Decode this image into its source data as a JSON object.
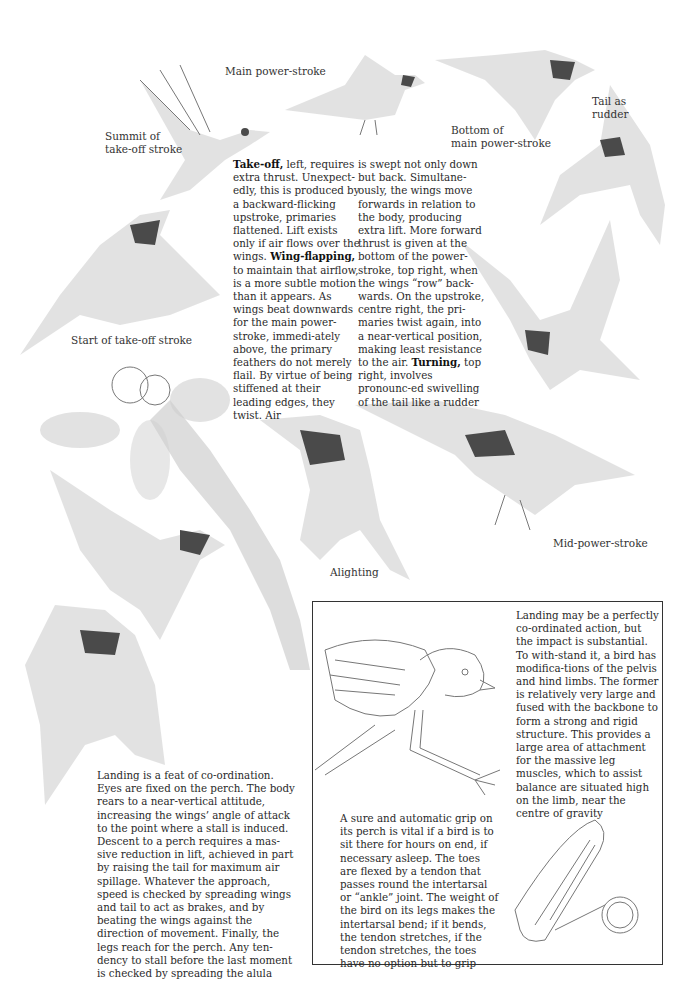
{
  "labels": {
    "main_power_stroke": "Main power-stroke",
    "summit_take_off": [
      "Summit of",
      "take-off stroke"
    ],
    "bottom_main_power": [
      "Bottom of",
      "main power-stroke"
    ],
    "tail_as_rudder": [
      "Tail as",
      "rudder"
    ],
    "start_take_off": "Start of take-off stroke",
    "alighting": "Alighting",
    "mid_power_stroke": "Mid-power-stroke"
  },
  "flight_text": {
    "column1": {
      "takeoff_bold": "Take-off,",
      "takeoff_rest": " left, requires extra thrust. Unexpect-edly, this is produced by a backward-flicking upstroke, primaries flattened. Lift exists only if air flows over the wings. ",
      "wingflapping_bold": "Wing-flapping,",
      "wingflapping_rest": " to maintain that airflow, is a more subtle motion than it appears. As wings beat downwards for the main power-stroke, immedi-ately above, the primary feathers do not merely flail. By virtue of being stiffened at their leading edges, they twist. Air"
    },
    "column2": {
      "part1": "is swept not only down but back. Simultane-ously, the wings move forwards in relation to the body, producing extra lift. More forward thrust is given at the bottom of the power-stroke, top right, when the wings “row” back-wards. On the upstroke, centre right, the pri-maries twist again, into a near-vertical position, making least resistance to the air. ",
      "turning_bold": "Turning,",
      "part2": " top right, involves pronounc-ed swivelling of the tail like a rudder"
    }
  },
  "landing_text": "Landing is a feat of co-ordination. Eyes are fixed on the perch. The body rears to a near-vertical attitude, increasing the wings’ angle of attack to the point where a stall is induced. Descent to a perch requires a mas-sive reduction in lift, achieved in part by raising the tail for maximum air spillage. Whatever the approach, speed is checked by spreading wings and tail to act as brakes, and by beating the wings against the direction of movement. Finally, the legs reach for the perch. Any ten-dency to stall before the last moment is checked by spreading the alula",
  "box": {
    "impact_text": "Landing may be a perfectly co-ordinated action, but the impact is substantial. To with-stand it, a bird has modifica-tions of the pelvis and hind limbs. The former is relatively very large and fused with the backbone to form a strong and rigid structure. This provides a large area of attachment for the massive leg muscles, which to assist balance are situated high on the limb, near the centre of gravity",
    "grip_text": "A sure and automatic grip on its perch is vital if a bird is to sit there for hours on end, if necessary asleep. The toes are flexed by a tendon that passes round the intertarsal or “ankle” joint. The weight of the bird on its legs makes the intertarsal bend; if it bends, the tendon stretches, if the tendon stretches, the toes have no option but to grip"
  }
}
